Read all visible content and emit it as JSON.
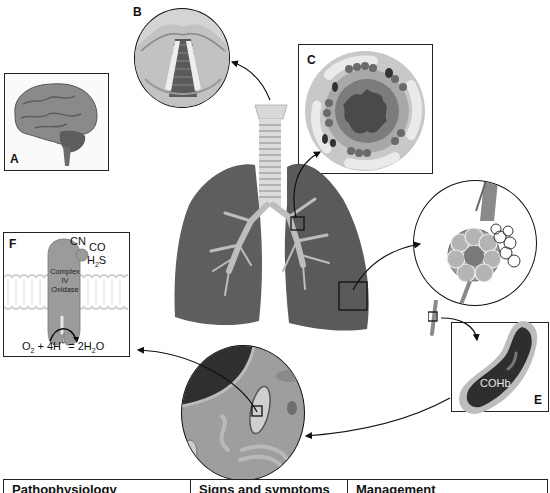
{
  "panels": {
    "A": {
      "label": "A",
      "subject": "brain"
    },
    "B": {
      "label": "B",
      "subject": "larynx / vocal cords"
    },
    "C": {
      "label": "C",
      "subject": "bronchiole cross-section"
    },
    "D": {
      "label": "D",
      "subject": "alveoli"
    },
    "E": {
      "label": "E",
      "subject": "capillary with carboxyhemoglobin",
      "text": "COHb"
    },
    "F": {
      "label": "F",
      "subject": "mitochondrial complex IV",
      "inhibitors": [
        "CN",
        "CO",
        "H2S"
      ],
      "inhibitor_cn": "CN",
      "inhibitor_co": "CO",
      "inhibitor_h2s_main": "H",
      "inhibitor_h2s_sub": "2",
      "inhibitor_h2s_end": "S",
      "enzyme_line1": "Complex",
      "enzyme_line2": "IV",
      "enzyme_line3": "Oxidase",
      "equation": "O2 + 4H+ = 2H2O",
      "eq_o": "O",
      "eq_2a": "2",
      "eq_mid": " + 4H",
      "eq_plus": "+",
      "eq_eq": " = 2H",
      "eq_2b": "2",
      "eq_end": "O"
    },
    "center": {
      "subject": "lungs and trachea"
    },
    "mito": {
      "subject": "cell with mitochondrion"
    }
  },
  "table": {
    "headers": [
      "Pathophysiology",
      "Signs and symptoms",
      "Management"
    ]
  },
  "colors": {
    "lung": "#5a5a5a",
    "airway": "#cfcfcf",
    "outline": "#222222",
    "background": "#ffffff"
  }
}
